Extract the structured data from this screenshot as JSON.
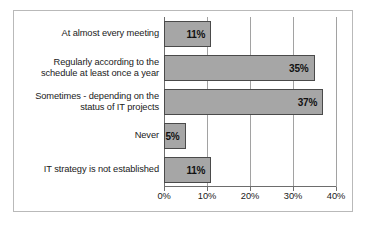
{
  "chart_data": {
    "type": "bar",
    "orientation": "horizontal",
    "title": "",
    "xlabel": "",
    "ylabel": "",
    "grid": true,
    "legend": false,
    "xlim": [
      0,
      40
    ],
    "xtick_labels": [
      "0%",
      "10%",
      "20%",
      "30%",
      "40%"
    ],
    "xtick_values": [
      0,
      10,
      20,
      30,
      40
    ],
    "categories": [
      "At almost every meeting",
      "Regularly according to the schedule at least once a year",
      "Sometimes - depending on the status of IT projects",
      "Never",
      "IT strategy is not established"
    ],
    "values": [
      11,
      35,
      37,
      5,
      11
    ],
    "data_labels": [
      "11%",
      "35%",
      "37%",
      "5%",
      "11%"
    ],
    "bar_fill_color": "#a6a6a6",
    "bar_border_color": "#4a4a4a",
    "gridline_color": "#a2a2a2",
    "axis_color": "#6d6d6d",
    "frame_color": "#b9b9b9",
    "text_color": "#1a1a1a"
  }
}
